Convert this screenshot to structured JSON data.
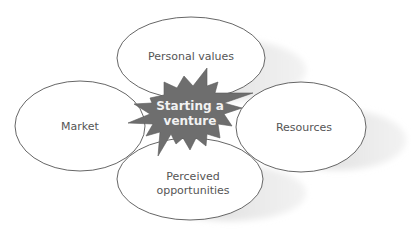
{
  "diagram": {
    "type": "hub-and-spoke",
    "hub": {
      "id": "hub",
      "label_lines": [
        "Starting a",
        "venture"
      ],
      "shape": "starburst",
      "fill": "#6e6e6e",
      "text_color": "#f2f2f2"
    },
    "nodes": [
      {
        "id": "personal-values",
        "label_lines": [
          "Personal values"
        ],
        "position": "top"
      },
      {
        "id": "market",
        "label_lines": [
          "Market"
        ],
        "position": "left"
      },
      {
        "id": "resources",
        "label_lines": [
          "Resources"
        ],
        "position": "right"
      },
      {
        "id": "perceived-opportunities",
        "label_lines": [
          "Perceived",
          "opportunities"
        ],
        "position": "bottom"
      }
    ],
    "colors": {
      "ellipse_fill": "#ffffff",
      "ellipse_stroke": "#555555",
      "shadow": "#d9d9d9",
      "text": "#555555"
    }
  }
}
